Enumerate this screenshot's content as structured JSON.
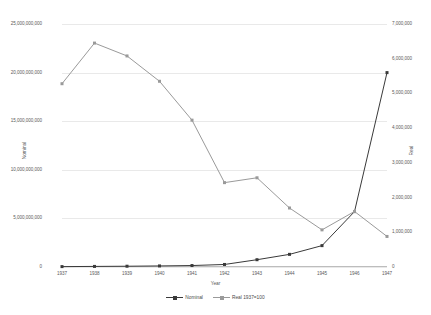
{
  "chart_data": {
    "type": "line",
    "title": "",
    "xlabel": "Year",
    "ylabel": "Nominal",
    "y2label": "Real",
    "categories": [
      "1937",
      "1938",
      "1939",
      "1940",
      "1941",
      "1942",
      "1943",
      "1944",
      "1945",
      "1946",
      "1947"
    ],
    "ylim": [
      0,
      25000000000
    ],
    "y2lim": [
      0,
      7000000
    ],
    "yticks": [
      "0",
      "5,000,000,000",
      "10,000,000,000",
      "15,000,000,000",
      "20,000,000,000",
      "25,000,000,000"
    ],
    "ytick_values": [
      0,
      5000000000,
      10000000000,
      15000000000,
      20000000000,
      25000000000
    ],
    "y2ticks": [
      "0",
      "1,000,000",
      "2,000,000",
      "3,000,000",
      "4,000,000",
      "5,000,000",
      "6,000,000",
      "7,000,000"
    ],
    "y2tick_values": [
      0,
      1000000,
      2000000,
      3000000,
      4000000,
      5000000,
      6000000,
      7000000
    ],
    "grid": true,
    "legend_position": "bottom",
    "series": [
      {
        "name": "Nominal",
        "axis": "left",
        "color": "#3a3a3a",
        "marker": "square",
        "values": [
          40000000,
          60000000,
          80000000,
          110000000,
          150000000,
          260000000,
          750000000,
          1300000000,
          2200000000,
          5700000000,
          20000000000
        ]
      },
      {
        "name": "Real 1937=100",
        "axis": "right",
        "color": "#9a9a9a",
        "marker": "square",
        "values": [
          5280000,
          6450000,
          6080000,
          5350000,
          4230000,
          2430000,
          2570000,
          1700000,
          1070000,
          1600000,
          880000
        ]
      }
    ]
  },
  "legend": {
    "items": [
      {
        "label": "Nominal",
        "color": "#3a3a3a"
      },
      {
        "label": "Real 1937=100",
        "color": "#9a9a9a"
      }
    ]
  },
  "colors": {
    "nominal": "#3a3a3a",
    "real": "#9a9a9a",
    "grid": "#e9e9e9",
    "axis": "#bdbdbd",
    "text": "#5a5a5a",
    "background": "#ffffff"
  }
}
